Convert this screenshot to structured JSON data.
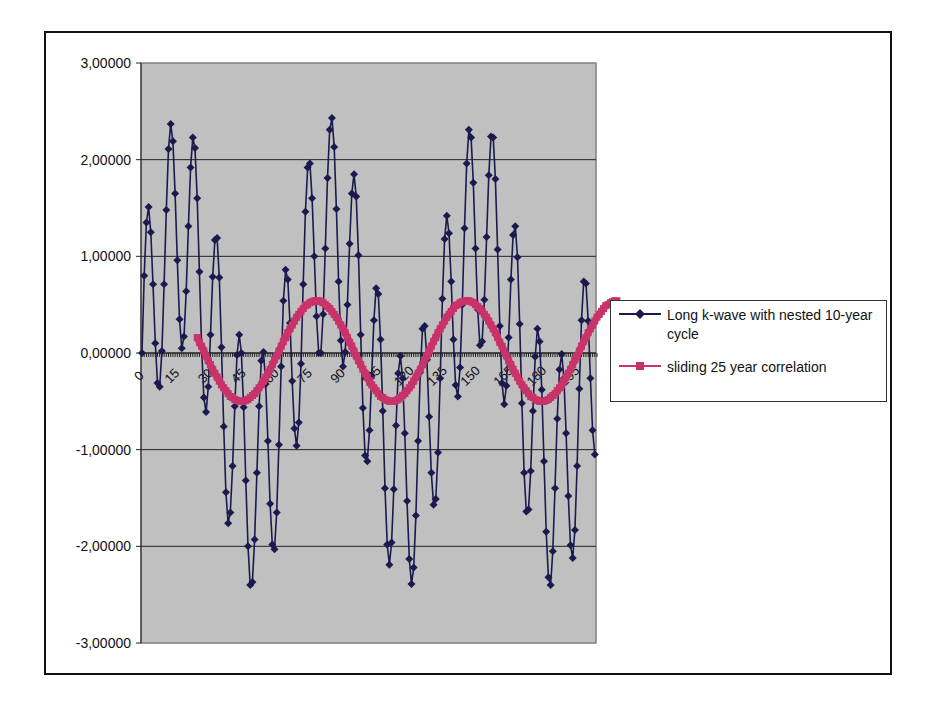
{
  "chart_data": {
    "type": "line",
    "title": "",
    "xlabel": "",
    "ylabel": "",
    "ylim": [
      -3,
      3
    ],
    "xlim": [
      0,
      205
    ],
    "grid": {
      "horizontal": true,
      "vertical": false
    },
    "legend_position": "right",
    "plot_background": "#c0c0c0",
    "yticks": [
      3,
      2,
      1,
      0,
      -1,
      -2,
      -3
    ],
    "ytick_labels": [
      "3,00000",
      "2,00000",
      "1,00000",
      "0,00000",
      "-1,00000",
      "-2,00000",
      "-3,00000"
    ],
    "xticks": [
      0,
      15,
      30,
      45,
      60,
      75,
      90,
      105,
      120,
      135,
      150,
      165,
      180,
      195
    ],
    "xtick_labels": [
      "0",
      "15",
      "30",
      "45",
      "60",
      "75",
      "90",
      "105",
      "120",
      "135",
      "150",
      "165",
      "180",
      "195"
    ],
    "series": [
      {
        "name": "Long k-wave with nested 10-year cycle",
        "color": "#1a1a4e",
        "marker": "diamond",
        "x_start": 0,
        "values": [
          0.0,
          0.8,
          1.35,
          1.51,
          1.25,
          0.71,
          0.1,
          -0.31,
          -0.35,
          0.02,
          0.71,
          1.48,
          2.11,
          2.37,
          2.19,
          1.65,
          0.96,
          0.35,
          0.05,
          0.17,
          0.64,
          1.31,
          1.92,
          2.23,
          2.12,
          1.6,
          0.84,
          0.07,
          -0.46,
          -0.61,
          -0.35,
          0.19,
          0.79,
          1.17,
          1.19,
          0.78,
          0.06,
          -0.76,
          -1.44,
          -1.76,
          -1.65,
          -1.17,
          -0.55,
          -0.02,
          0.19,
          0.0,
          -0.56,
          -1.32,
          -2.0,
          -2.4,
          -2.37,
          -1.93,
          -1.24,
          -0.55,
          -0.08,
          0.01,
          -0.32,
          -0.91,
          -1.56,
          -1.98,
          -2.03,
          -1.65,
          -0.95,
          -0.14,
          0.54,
          0.86,
          0.76,
          0.31,
          -0.29,
          -0.78,
          -0.96,
          -0.72,
          -0.11,
          0.71,
          1.46,
          1.92,
          1.96,
          1.6,
          1.0,
          0.38,
          0.0,
          0.0,
          0.4,
          1.08,
          1.81,
          2.31,
          2.43,
          2.13,
          1.49,
          0.74,
          0.13,
          -0.14,
          0.01,
          0.5,
          1.13,
          1.65,
          1.85,
          1.62,
          1.01,
          0.19,
          -0.57,
          -1.06,
          -1.12,
          -0.8,
          -0.23,
          0.34,
          0.67,
          0.61,
          0.14,
          -0.6,
          -1.4,
          -1.98,
          -2.19,
          -1.96,
          -1.41,
          -0.75,
          -0.21,
          -0.03,
          -0.26,
          -0.83,
          -1.53,
          -2.13,
          -2.39,
          -2.22,
          -1.68,
          -0.91,
          -0.2,
          0.25,
          0.28,
          -0.07,
          -0.66,
          -1.24,
          -1.57,
          -1.51,
          -1.03,
          -0.26,
          0.56,
          1.18,
          1.42,
          1.24,
          0.74,
          0.14,
          -0.33,
          -0.45,
          -0.15,
          0.5,
          1.29,
          1.96,
          2.31,
          2.23,
          1.76,
          1.08,
          0.45,
          0.08,
          0.12,
          0.55,
          1.2,
          1.84,
          2.24,
          2.23,
          1.8,
          1.07,
          0.28,
          -0.31,
          -0.53,
          -0.34,
          0.16,
          0.76,
          1.22,
          1.31,
          0.99,
          0.3,
          -0.52,
          -1.24,
          -1.64,
          -1.62,
          -1.22,
          -0.6,
          -0.04,
          0.25,
          0.12,
          -0.38,
          -1.12,
          -1.85,
          -2.32,
          -2.4,
          -2.05,
          -1.4,
          -0.68,
          -0.17,
          -0.01,
          -0.26,
          -0.83,
          -1.48,
          -1.99,
          -2.12,
          -1.83,
          -1.17,
          -0.37,
          0.34,
          0.74,
          0.72,
          0.33,
          -0.26,
          -0.8,
          -1.05
        ]
      },
      {
        "name": "sliding 25 year correlation",
        "color": "#c8336a",
        "marker": "square",
        "x_start": 25,
        "values": [
          0.16,
          0.11,
          0.07,
          0.02,
          -0.03,
          -0.08,
          -0.12,
          -0.17,
          -0.21,
          -0.25,
          -0.29,
          -0.33,
          -0.36,
          -0.39,
          -0.42,
          -0.45,
          -0.46,
          -0.48,
          -0.49,
          -0.5,
          -0.5,
          -0.5,
          -0.49,
          -0.48,
          -0.46,
          -0.44,
          -0.42,
          -0.39,
          -0.36,
          -0.33,
          -0.29,
          -0.25,
          -0.21,
          -0.17,
          -0.12,
          -0.07,
          -0.03,
          0.02,
          0.07,
          0.12,
          0.16,
          0.21,
          0.25,
          0.29,
          0.33,
          0.37,
          0.4,
          0.43,
          0.46,
          0.49,
          0.5,
          0.52,
          0.53,
          0.54,
          0.54,
          0.54,
          0.53,
          0.52,
          0.5,
          0.48,
          0.46,
          0.43,
          0.4,
          0.37,
          0.33,
          0.29,
          0.25,
          0.21,
          0.16,
          0.11,
          0.07,
          0.02,
          -0.03,
          -0.08,
          -0.12,
          -0.17,
          -0.21,
          -0.25,
          -0.29,
          -0.33,
          -0.36,
          -0.39,
          -0.42,
          -0.45,
          -0.46,
          -0.48,
          -0.49,
          -0.5,
          -0.5,
          -0.5,
          -0.49,
          -0.48,
          -0.46,
          -0.44,
          -0.42,
          -0.39,
          -0.36,
          -0.33,
          -0.29,
          -0.25,
          -0.21,
          -0.17,
          -0.12,
          -0.07,
          -0.03,
          0.02,
          0.07,
          0.12,
          0.16,
          0.21,
          0.25,
          0.29,
          0.33,
          0.37,
          0.4,
          0.43,
          0.46,
          0.49,
          0.5,
          0.52,
          0.53,
          0.54,
          0.54,
          0.54,
          0.53,
          0.52,
          0.5,
          0.48,
          0.46,
          0.43,
          0.4,
          0.37,
          0.33,
          0.29,
          0.25,
          0.21,
          0.16,
          0.11,
          0.07,
          0.02,
          -0.03,
          -0.08,
          -0.12,
          -0.17,
          -0.21,
          -0.25,
          -0.29,
          -0.33,
          -0.36,
          -0.39,
          -0.42,
          -0.45,
          -0.46,
          -0.48,
          -0.49,
          -0.5,
          -0.5,
          -0.5,
          -0.49,
          -0.48,
          -0.46,
          -0.44,
          -0.42,
          -0.39,
          -0.36,
          -0.33,
          -0.29,
          -0.25,
          -0.21,
          -0.17,
          -0.12,
          -0.07,
          -0.03,
          0.02,
          0.07,
          0.12,
          0.16,
          0.21,
          0.25,
          0.29,
          0.33,
          0.37,
          0.4,
          0.43,
          0.46,
          0.49,
          0.5,
          0.52,
          0.53,
          0.54,
          0.54
        ]
      }
    ]
  },
  "legend": {
    "items": [
      {
        "label": "Long k-wave with nested 10-year cycle",
        "color": "#1a1a4e",
        "marker": "diamond-icon"
      },
      {
        "label": "sliding 25 year correlation",
        "color": "#c8336a",
        "marker": "square-icon"
      }
    ]
  }
}
